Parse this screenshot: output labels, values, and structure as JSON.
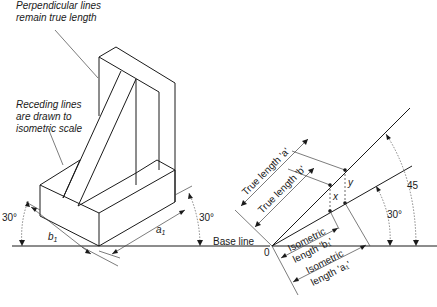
{
  "figure": {
    "annotations": {
      "perpendicular_line1": "Perpendicular lines",
      "perpendicular_line2": "remain true length",
      "receding_line1": "Receding lines",
      "receding_line2": "are drawn to",
      "receding_line3": "isometric scale"
    },
    "left_view": {
      "angle_left": "30°",
      "angle_right": "30°",
      "dim_b": "b",
      "dim_b_sub": "1",
      "dim_a": "a",
      "dim_a_sub": "1",
      "base_line": "Base line"
    },
    "right_view": {
      "origin": "0",
      "true_length_a": "True length 'a'",
      "true_length_b": "True length 'b'",
      "x_label": "x",
      "y_label": "y",
      "angle_45": "45",
      "angle_30": "30°",
      "iso_b_line1": "Isometric",
      "iso_b_line2": "length 'b₁'",
      "iso_a_line1": "Isometric",
      "iso_a_line2": "length 'a₁'"
    }
  }
}
